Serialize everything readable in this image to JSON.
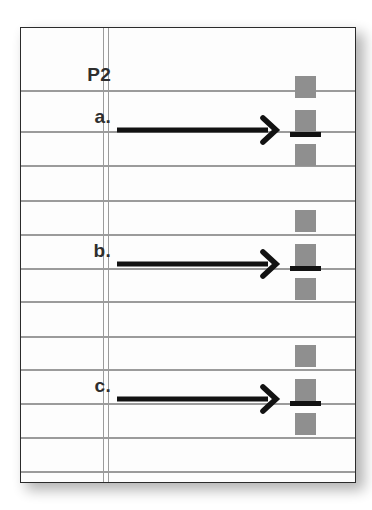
{
  "page": {
    "header_label": "P2",
    "background_color": "#ffffff",
    "sheet_color": "#fdfdfd",
    "border_color": "#2b2b2b",
    "rule_color": "#9b9b9b",
    "square_color": "#8f8f8f",
    "bar_color": "#121212",
    "arrow_color": "#121212"
  },
  "ruled_lines": {
    "count": 13,
    "y_positions": [
      62,
      103,
      137,
      172,
      206,
      240,
      273,
      308,
      341,
      375,
      409,
      443,
      456
    ],
    "vertical_margin_x": [
      82,
      87
    ]
  },
  "rows": [
    {
      "label": "P2",
      "type": "header",
      "label_y": 36
    },
    {
      "label": "a.",
      "type": "problem",
      "label_y": 78,
      "arrow": {
        "name": "right-arrow",
        "start_x": 95,
        "end_x": 243,
        "y": 102,
        "thickness": 5
      },
      "squares": [
        {
          "x": 274,
          "y": 48
        },
        {
          "x": 274,
          "y": 82
        },
        {
          "x": 274,
          "y": 116
        }
      ],
      "bar": {
        "x": 269,
        "y": 104
      }
    },
    {
      "label": "b.",
      "type": "problem",
      "label_y": 212,
      "arrow": {
        "name": "right-arrow",
        "start_x": 95,
        "end_x": 243,
        "y": 236,
        "thickness": 5
      },
      "squares": [
        {
          "x": 274,
          "y": 182
        },
        {
          "x": 274,
          "y": 216
        },
        {
          "x": 274,
          "y": 250
        }
      ],
      "bar": {
        "x": 269,
        "y": 238
      }
    },
    {
      "label": "c.",
      "type": "problem",
      "label_y": 347,
      "arrow": {
        "name": "right-arrow",
        "start_x": 95,
        "end_x": 243,
        "y": 371,
        "thickness": 5
      },
      "squares": [
        {
          "x": 274,
          "y": 317
        },
        {
          "x": 274,
          "y": 351
        },
        {
          "x": 274,
          "y": 385
        }
      ],
      "bar": {
        "x": 269,
        "y": 373
      }
    }
  ]
}
